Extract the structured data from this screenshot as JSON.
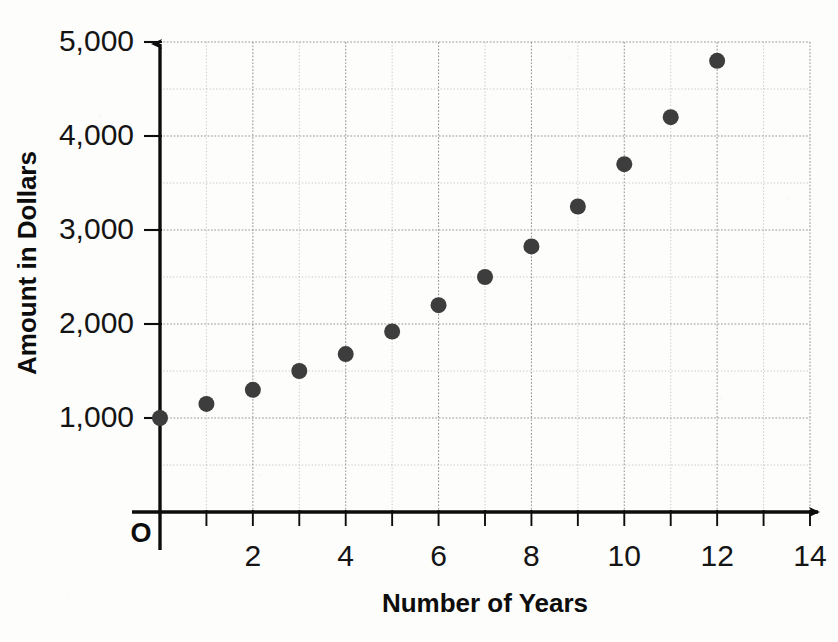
{
  "chart_data": {
    "type": "scatter",
    "title": "",
    "xlabel": "Number of Years",
    "ylabel": "Amount in Dollars",
    "origin_label": "O",
    "xlim": [
      0,
      14
    ],
    "ylim": [
      0,
      5000
    ],
    "grid": true,
    "grid_style": "dotted",
    "legend": "none",
    "x_major_step": 2,
    "x_minor_step": 1,
    "y_major_step": 1000,
    "y_minor_step": 500,
    "x_tick_labels": [
      "2",
      "4",
      "6",
      "8",
      "10",
      "12",
      "14"
    ],
    "x_tick_values": [
      2,
      4,
      6,
      8,
      10,
      12,
      14
    ],
    "y_tick_labels": [
      "1,000",
      "2,000",
      "3,000",
      "4,000",
      "5,000"
    ],
    "y_tick_values": [
      1000,
      2000,
      3000,
      4000,
      5000
    ],
    "x": [
      0,
      1,
      2,
      3,
      4,
      5,
      6,
      7,
      8,
      9,
      10,
      11,
      12
    ],
    "values": [
      1000,
      1150,
      1300,
      1500,
      1680,
      1920,
      2200,
      2500,
      2825,
      3250,
      3700,
      4200,
      4800
    ],
    "points": [
      {
        "x": 0,
        "y": 1000
      },
      {
        "x": 1,
        "y": 1150
      },
      {
        "x": 2,
        "y": 1300
      },
      {
        "x": 3,
        "y": 1500
      },
      {
        "x": 4,
        "y": 1680
      },
      {
        "x": 5,
        "y": 1920
      },
      {
        "x": 6,
        "y": 2200
      },
      {
        "x": 7,
        "y": 2500
      },
      {
        "x": 8,
        "y": 2825
      },
      {
        "x": 9,
        "y": 3250
      },
      {
        "x": 10,
        "y": 3700
      },
      {
        "x": 11,
        "y": 4200
      },
      {
        "x": 12,
        "y": 4800
      }
    ],
    "marker": {
      "shape": "circle",
      "color": "#3d3d3d",
      "radius_px": 8
    },
    "colors": {
      "axis": "#0d0d0d",
      "grid_major": "#8d8d8d",
      "grid_minor": "#a8a8a8",
      "text": "#141414",
      "background": "#fdfdfb"
    }
  }
}
